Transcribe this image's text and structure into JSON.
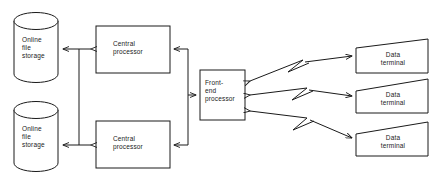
{
  "diagram": {
    "line_color": "#1a1a1a",
    "background_color": "#ffffff",
    "nodes": {
      "storage_top": {
        "label": "Online\nfile\nstorage",
        "shape": "cylinder"
      },
      "storage_bottom": {
        "label": "Online\nfile\nstorage",
        "shape": "cylinder"
      },
      "cpu_top": {
        "label": "Central\nprocessor",
        "shape": "rectangle"
      },
      "cpu_bottom": {
        "label": "Central\nprocessor",
        "shape": "rectangle"
      },
      "front_end": {
        "label": "Front-\nend\nprocessor",
        "shape": "rectangle"
      },
      "terminal_1": {
        "label": "Data\nterminal",
        "shape": "slanted-rectangle"
      },
      "terminal_2": {
        "label": "Data\nterminal",
        "shape": "slanted-rectangle"
      },
      "terminal_3": {
        "label": "Data\nterminal",
        "shape": "slanted-rectangle"
      }
    },
    "connections": [
      {
        "from": "storage_top",
        "to": "cpu_top",
        "style": "double-arrow"
      },
      {
        "from": "storage_bottom",
        "to": "cpu_bottom",
        "style": "double-arrow"
      },
      {
        "from": "storage_top",
        "to": "storage_bottom",
        "style": "bus-line"
      },
      {
        "from": "front_end",
        "to": "cpu_top",
        "style": "arrow"
      },
      {
        "from": "front_end",
        "to": "cpu_bottom",
        "style": "arrow"
      },
      {
        "from": "cpu_bus",
        "to": "front_end",
        "style": "arrow"
      },
      {
        "from": "front_end",
        "to": "terminal_1",
        "style": "zigzag-double-arrow"
      },
      {
        "from": "front_end",
        "to": "terminal_2",
        "style": "zigzag-double-arrow"
      },
      {
        "from": "front_end",
        "to": "terminal_3",
        "style": "zigzag-double-arrow"
      }
    ]
  }
}
